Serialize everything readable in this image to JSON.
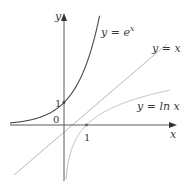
{
  "diagram": {
    "origin_px": [
      64,
      125
    ],
    "unit_px": 22.5,
    "axes": {
      "x_label": "x",
      "y_label": "y",
      "origin_label": "0",
      "x_tick_label": "1",
      "y_tick_label": "1"
    },
    "curves": [
      {
        "id": "exp",
        "label_prefix": "y = e",
        "label_sup": "x",
        "color": "#4a4a4a"
      },
      {
        "id": "identity",
        "label": "y = x",
        "color": "#b5b5b5"
      },
      {
        "id": "ln",
        "label": "y = ln x",
        "color": "#b5b5b5"
      }
    ],
    "colors": {
      "axes": "#5a5a5a",
      "text": "#3a3a3a"
    }
  }
}
